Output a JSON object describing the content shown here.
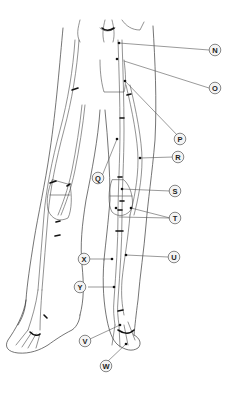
{
  "diagram": {
    "labels": [
      {
        "id": "N",
        "text": "N"
      },
      {
        "id": "O",
        "text": "O"
      },
      {
        "id": "P",
        "text": "P"
      },
      {
        "id": "Q",
        "text": "Q"
      },
      {
        "id": "R",
        "text": "R"
      },
      {
        "id": "S",
        "text": "S"
      },
      {
        "id": "T",
        "text": "T"
      },
      {
        "id": "U",
        "text": "U"
      },
      {
        "id": "V",
        "text": "V"
      },
      {
        "id": "W",
        "text": "W"
      },
      {
        "id": "X",
        "text": "X"
      },
      {
        "id": "Y",
        "text": "Y"
      }
    ]
  }
}
